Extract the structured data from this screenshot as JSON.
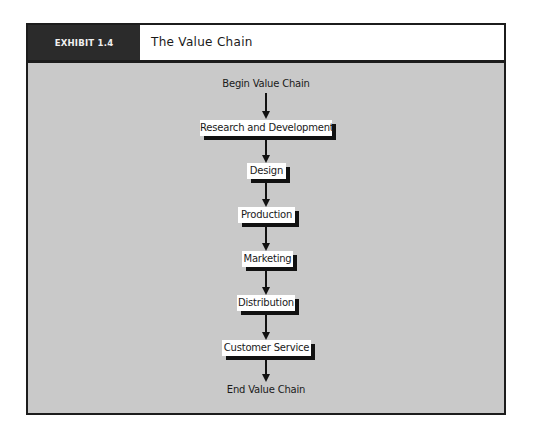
{
  "header": {
    "tag": "EXHIBIT 1.4",
    "title": "The Value Chain"
  },
  "colors": {
    "frame_border": "#1c1c1c",
    "header_tag_bg": "#2b2b2b",
    "panel_bg": "#c9c9c9",
    "box_bg": "#ffffff",
    "shadow": "#111111"
  },
  "chain": {
    "start_label": "Begin Value Chain",
    "end_label": "End Value Chain",
    "steps": [
      {
        "label": "Research and Development"
      },
      {
        "label": "Design"
      },
      {
        "label": "Production"
      },
      {
        "label": "Marketing"
      },
      {
        "label": "Distribution"
      },
      {
        "label": "Customer Service"
      }
    ]
  }
}
